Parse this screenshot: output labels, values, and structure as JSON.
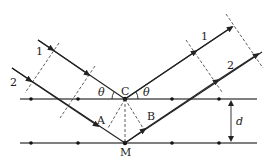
{
  "diagram": {
    "labels": {
      "ray1_in": "1",
      "ray2_in": "2",
      "ray1_out": "1",
      "ray2_out": "2",
      "point_c": "C",
      "point_m": "M",
      "point_a": "A",
      "point_b": "B",
      "theta_left": "θ",
      "theta_right": "θ",
      "spacing": "d"
    },
    "colors": {
      "line": "#222222",
      "plane": "#555555",
      "background": "#ffffff"
    }
  }
}
